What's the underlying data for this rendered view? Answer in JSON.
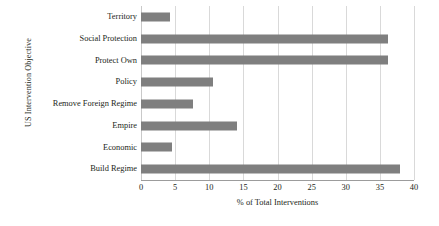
{
  "chart_data": {
    "type": "bar",
    "orientation": "horizontal",
    "title": "",
    "xlabel": "% of Total Interventions",
    "ylabel": "US Intervention Objective",
    "xlim": [
      0,
      40
    ],
    "xticks": [
      0,
      5,
      10,
      15,
      20,
      25,
      30,
      35,
      40
    ],
    "grid": "vertical",
    "legend": "none",
    "bar_color": "#7f7f7f",
    "gridline_color": "#d9d9d9",
    "text_color": "#231f20",
    "categories": [
      "Territory",
      "Social Protection",
      "Protect Own",
      "Policy",
      "Remove Foreign Regime",
      "Empire",
      "Economic",
      "Build Regime"
    ],
    "values": [
      4.3,
      36.2,
      36.2,
      10.5,
      7.6,
      14.1,
      4.5,
      38.0
    ]
  },
  "axes": {
    "x_title": "% of Total Interventions",
    "y_title": "US Intervention Objective",
    "x_tick_labels": [
      "0",
      "5",
      "10",
      "15",
      "20",
      "25",
      "30",
      "35",
      "40"
    ]
  },
  "bars": [
    {
      "label": "Territory",
      "value": 4.3
    },
    {
      "label": "Social Protection",
      "value": 36.2
    },
    {
      "label": "Protect Own",
      "value": 36.2
    },
    {
      "label": "Policy",
      "value": 10.5
    },
    {
      "label": "Remove Foreign Regime",
      "value": 7.6
    },
    {
      "label": "Empire",
      "value": 14.1
    },
    {
      "label": "Economic",
      "value": 4.5
    },
    {
      "label": "Build Regime",
      "value": 38.0
    }
  ]
}
